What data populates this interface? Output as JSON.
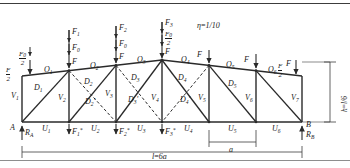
{
  "figure": {
    "type": "structural-truss-diagram",
    "name": "Symmetric roof truss with joint loads",
    "ratio_note": {
      "symbol": "η",
      "equals": "=",
      "value": "1/10",
      "full": "η=1/10"
    },
    "span_label": {
      "var": "l",
      "equals": "=",
      "value": "6a",
      "full": "l=6a"
    },
    "height_label": {
      "var": "h",
      "equals": "=",
      "value": "l/6",
      "full": "h=l/6"
    },
    "panel_label": "a"
  },
  "supports": {
    "left": {
      "node": "A",
      "reaction": "R",
      "reaction_sub": "A"
    },
    "right": {
      "node": "B",
      "reaction": "R",
      "reaction_sub": "B"
    }
  },
  "top_loads": [
    {
      "id": "load-left-end",
      "parts": [
        {
          "kind": "fraction",
          "num": "F",
          "den": "2"
        },
        {
          "kind": "fraction",
          "num": "F₀",
          "den": "2",
          "num_base": "F",
          "num_sub": "0"
        }
      ]
    },
    {
      "id": "load-1",
      "parts": [
        {
          "kind": "plain",
          "base": "F",
          "sub": "1"
        },
        {
          "kind": "plain",
          "base": "F",
          "sub": "0"
        },
        {
          "kind": "plain",
          "base": "F",
          "sub": ""
        }
      ]
    },
    {
      "id": "load-2",
      "parts": [
        {
          "kind": "plain",
          "base": "F",
          "sub": "2"
        },
        {
          "kind": "plain",
          "base": "F",
          "sub": "0"
        },
        {
          "kind": "plain",
          "base": "F",
          "sub": ""
        }
      ]
    },
    {
      "id": "load-3",
      "parts": [
        {
          "kind": "plain",
          "base": "F",
          "sub": "3"
        },
        {
          "kind": "fraction",
          "num_base": "F",
          "num_sub": "0",
          "den": "2"
        },
        {
          "kind": "plain",
          "base": "F",
          "sub": ""
        }
      ]
    },
    {
      "id": "load-4",
      "parts": [
        {
          "kind": "plain",
          "base": "F",
          "sub": ""
        }
      ]
    },
    {
      "id": "load-5",
      "parts": [
        {
          "kind": "plain",
          "base": "F",
          "sub": ""
        }
      ]
    },
    {
      "id": "load-right-end",
      "parts": [
        {
          "kind": "fraction",
          "num": "F",
          "den": "2"
        }
      ]
    }
  ],
  "bottom_loads": [
    {
      "base": "F",
      "sub": "1",
      "sup": "*"
    },
    {
      "base": "F",
      "sub": "2",
      "sup": "*"
    },
    {
      "base": "F",
      "sub": "3",
      "sup": "*"
    }
  ],
  "members": {
    "top_chord": [
      "O₁",
      "O₂",
      "O₃",
      "O₄",
      "O₅",
      "O₆"
    ],
    "top_chord_parts": [
      {
        "base": "O",
        "sub": "1"
      },
      {
        "base": "O",
        "sub": "2"
      },
      {
        "base": "O",
        "sub": "3"
      },
      {
        "base": "O",
        "sub": "4"
      },
      {
        "base": "O",
        "sub": "5"
      },
      {
        "base": "O",
        "sub": "6"
      }
    ],
    "bottom_chord_parts": [
      {
        "base": "U",
        "sub": "1"
      },
      {
        "base": "U",
        "sub": "2"
      },
      {
        "base": "U",
        "sub": "3"
      },
      {
        "base": "U",
        "sub": "4"
      },
      {
        "base": "U",
        "sub": "5"
      },
      {
        "base": "U",
        "sub": "6"
      }
    ],
    "verticals_parts": [
      {
        "base": "V",
        "sub": "1"
      },
      {
        "base": "V",
        "sub": "2"
      },
      {
        "base": "V",
        "sub": "3"
      },
      {
        "base": "V",
        "sub": "4"
      },
      {
        "base": "V",
        "sub": "5"
      },
      {
        "base": "V",
        "sub": "6"
      },
      {
        "base": "V",
        "sub": "7"
      }
    ],
    "diagonals_parts": [
      {
        "base": "D",
        "sub": "1",
        "prime": ""
      },
      {
        "base": "D",
        "sub": "2",
        "prime": ""
      },
      {
        "base": "D",
        "sub": "3",
        "prime": ""
      },
      {
        "base": "D",
        "sub": "4",
        "prime": ""
      },
      {
        "base": "D",
        "sub": "5",
        "prime": ""
      }
    ],
    "counter_diagonals_parts": [
      {
        "base": "D",
        "sub": "2",
        "prime": "'"
      },
      {
        "base": "D",
        "sub": "3",
        "prime": "'"
      },
      {
        "base": "D",
        "sub": "4",
        "prime": "'"
      }
    ]
  },
  "colors": {
    "line": "#2a2a2a",
    "thin": "#4a4a4a",
    "rule": "#3c3c3c",
    "rule_light": "#8e8e8e",
    "text": "#1a1a1a"
  }
}
